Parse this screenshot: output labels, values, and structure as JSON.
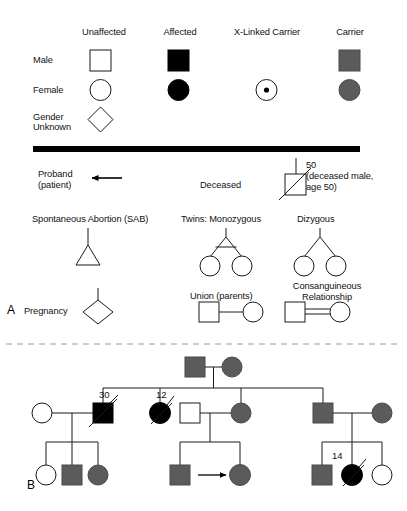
{
  "figure": {
    "panels": [
      {
        "id": "A",
        "letter": "A"
      },
      {
        "id": "B",
        "letter": "B"
      }
    ]
  },
  "legend": {
    "column_headers": [
      {
        "key": "unaffected",
        "label": "Unaffected"
      },
      {
        "key": "affected",
        "label": "Affected"
      },
      {
        "key": "xlinked",
        "label": "X-Linked Carrier"
      },
      {
        "key": "carrier",
        "label": "Carrier"
      }
    ],
    "row_headers": [
      {
        "key": "male",
        "label": "Male"
      },
      {
        "key": "female",
        "label": "Female"
      },
      {
        "key": "unknown",
        "label": "Gender",
        "label2": "Unknown"
      }
    ],
    "symbols": {
      "male_unaffected": "square-open",
      "male_affected": "square-filled-black",
      "male_carrier": "square-filled-gray",
      "female_unaffected": "circle-open",
      "female_affected": "circle-filled-black",
      "female_xlinked_carrier": "circle-with-center-dot",
      "female_carrier": "circle-filled-gray",
      "gender_unknown": "diamond-open"
    }
  },
  "notations": {
    "proband": {
      "line1": "Proband",
      "line2": "(patient)",
      "symbol": "left-arrow"
    },
    "deceased": {
      "label": "Deceased",
      "age": "50",
      "note_line1": "(deceased male,",
      "note_line2": "age 50)"
    },
    "sab": {
      "label": "Spontaneous Abortion (SAB)",
      "symbol": "triangle-open"
    },
    "twins_monozygous": {
      "label": "Twins: Monozygous"
    },
    "twins_dizygous": {
      "label": "Dizygous"
    },
    "pregnancy": {
      "label": "Pregnancy",
      "symbol_text": "P"
    },
    "union": {
      "label": "Union (parents)"
    },
    "consanguineous": {
      "line1": "Consanguineous",
      "line2": "Relationship"
    }
  },
  "pedigree": {
    "generations": [
      {
        "id": "I",
        "members": [
          {
            "id": "I-1",
            "sex": "male",
            "status": "carrier"
          },
          {
            "id": "I-2",
            "sex": "female",
            "status": "carrier"
          }
        ]
      },
      {
        "id": "II",
        "members": [
          {
            "id": "II-1",
            "sex": "female",
            "status": "unaffected"
          },
          {
            "id": "II-2",
            "sex": "male",
            "status": "affected",
            "deceased": true,
            "age": "30"
          },
          {
            "id": "II-3",
            "sex": "female",
            "status": "affected",
            "deceased": true,
            "age": "12"
          },
          {
            "id": "II-4",
            "sex": "male",
            "status": "unaffected"
          },
          {
            "id": "II-5",
            "sex": "female",
            "status": "carrier"
          },
          {
            "id": "II-6",
            "sex": "male",
            "status": "carrier"
          },
          {
            "id": "II-7",
            "sex": "female",
            "status": "carrier"
          }
        ]
      },
      {
        "id": "III",
        "members": [
          {
            "id": "III-1",
            "sex": "female",
            "status": "unaffected"
          },
          {
            "id": "III-2",
            "sex": "male",
            "status": "carrier"
          },
          {
            "id": "III-3",
            "sex": "female",
            "status": "carrier"
          },
          {
            "id": "III-4",
            "sex": "male",
            "status": "carrier"
          },
          {
            "id": "III-5",
            "sex": "female",
            "status": "carrier",
            "proband": true
          },
          {
            "id": "III-6",
            "sex": "male",
            "status": "carrier"
          },
          {
            "id": "III-7",
            "sex": "female",
            "status": "affected",
            "deceased": true,
            "age": "14"
          },
          {
            "id": "III-8",
            "sex": "female",
            "status": "unaffected"
          }
        ]
      }
    ],
    "age_labels": [
      "30",
      "12",
      "14"
    ]
  },
  "colors": {
    "affected": "#000000",
    "carrier": "#5b5b5b",
    "unaffected": "#ffffff",
    "stroke": "#1a1a1a",
    "background": "#ffffff",
    "divider": "#9a9a9a"
  }
}
